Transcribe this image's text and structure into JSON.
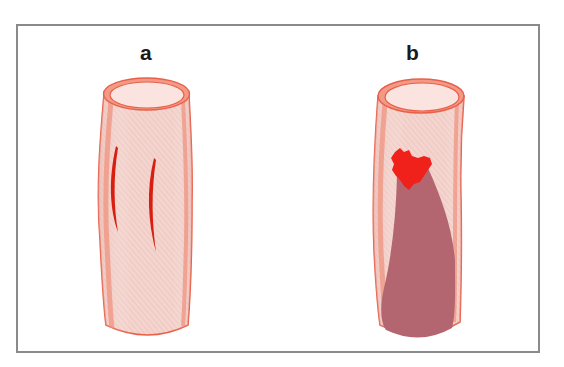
{
  "figure": {
    "panels": [
      {
        "id": "a",
        "label": "a",
        "depiction": "vessel with longitudinal intimal tears"
      },
      {
        "id": "b",
        "label": "b",
        "depiction": "vessel with thrombus and dissection"
      }
    ]
  },
  "colors": {
    "frame": "#8a8a8a",
    "vessel_wall": "#f0907a",
    "vessel_outline": "#e8604a",
    "vessel_fill": "#f6d6d0",
    "lumen_top": "#fbe4e0",
    "tear": "#d81e10",
    "thrombus": "#f0201a",
    "dissection": "#b46670"
  }
}
